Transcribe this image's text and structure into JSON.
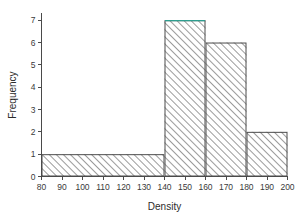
{
  "chart_data": {
    "type": "bar",
    "title": "",
    "subtitle": "",
    "xlabel": "Density",
    "ylabel": "Frequency",
    "xlim": [
      80,
      200
    ],
    "ylim": [
      0,
      7.3
    ],
    "grid": false,
    "legend": null,
    "bin_edges": [
      80,
      140,
      160,
      180,
      200
    ],
    "categories": [
      "80-140",
      "140-160",
      "160-180",
      "180-200"
    ],
    "values": [
      1,
      7,
      6,
      2
    ],
    "bars": [
      {
        "label": "80-140",
        "x0": 80,
        "x1": 140,
        "value": 1
      },
      {
        "label": "140-160",
        "x0": 140,
        "x1": 160,
        "value": 7
      },
      {
        "label": "160-180",
        "x0": 160,
        "x1": 180,
        "value": 6
      },
      {
        "label": "180-200",
        "x0": 180,
        "x1": 200,
        "value": 2
      }
    ],
    "xticks": [
      80,
      90,
      100,
      110,
      120,
      130,
      140,
      150,
      160,
      170,
      180,
      190,
      200
    ],
    "xtick_labels": [
      "80",
      "90",
      "100",
      "110",
      "120",
      "130",
      "140",
      "150",
      "160",
      "170",
      "180",
      "190",
      "200"
    ],
    "yticks": [
      0,
      1,
      2,
      3,
      4,
      5,
      6,
      7
    ],
    "ytick_labels": [
      "0",
      "1",
      "2",
      "3",
      "4",
      "5",
      "6",
      "7"
    ],
    "style": {
      "bar_fill": "#ffffff",
      "bar_hatch": "diagonal-forward",
      "hatch_color": "#6e6e6e",
      "bar_edge_color": "#4d4d4d",
      "highlight_edge_color": "#2e9e8f",
      "axis_color": "#4a4a4a",
      "text_color": "#2b2b2b",
      "background": "#ffffff"
    }
  },
  "figure": {
    "xlabel": "Density",
    "ylabel": "Frequency"
  }
}
